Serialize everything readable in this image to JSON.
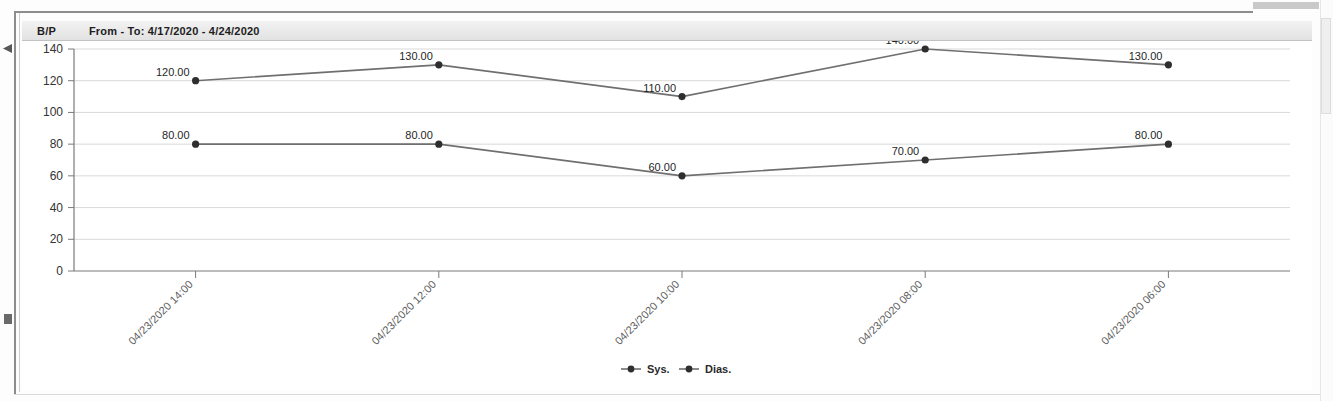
{
  "window": {
    "right_scroll": "vertical-scrollbar",
    "top_scroll": "horizontal-scrollbar"
  },
  "header": {
    "title": "B/P",
    "date_range": "From - To: 4/17/2020 - 4/24/2020"
  },
  "chart_data": {
    "type": "line",
    "title": "B/P",
    "subtitle": "From - To: 4/17/2020 - 4/24/2020",
    "xlabel": "",
    "ylabel": "",
    "ylim": [
      0,
      140
    ],
    "yticks": [
      0,
      20,
      40,
      60,
      80,
      100,
      120,
      140
    ],
    "ytick_labels": [
      "0",
      "20",
      "40",
      "60",
      "80",
      "100",
      "120",
      "140"
    ],
    "grid": true,
    "legend_position": "bottom",
    "categories": [
      "04/23/2020 14:00",
      "04/23/2020 12:00",
      "04/23/2020 10:00",
      "04/23/2020 08:00",
      "04/23/2020 06:00"
    ],
    "series": [
      {
        "name": "Sys.",
        "color": "#6f6f6f",
        "marker_color": "#2e2e2e",
        "values": [
          120,
          130,
          110,
          140,
          130
        ],
        "labels": [
          "120.00",
          "130.00",
          "110.00",
          "140.00",
          "130.00"
        ]
      },
      {
        "name": "Dias.",
        "color": "#6f6f6f",
        "marker_color": "#2e2e2e",
        "values": [
          80,
          80,
          60,
          70,
          80
        ],
        "labels": [
          "80.00",
          "80.00",
          "60.00",
          "70.00",
          "80.00"
        ]
      }
    ],
    "legend": [
      {
        "label": "Sys."
      },
      {
        "label": "Dias."
      }
    ],
    "colors": {
      "gridline": "#d9d9d9",
      "axis": "#7a7a7a",
      "series_line": "#6f6f6f",
      "marker": "#2e2e2e",
      "background": "#ffffff"
    }
  }
}
